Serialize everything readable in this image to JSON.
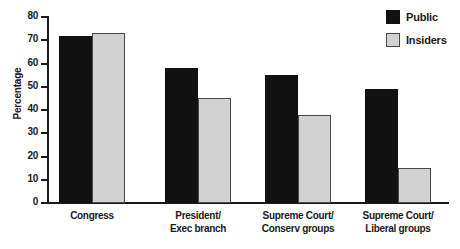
{
  "chart_data": {
    "type": "bar",
    "title": "",
    "xlabel": "",
    "ylabel": "Percentage",
    "ylim": [
      0,
      80
    ],
    "yticks": [
      0,
      10,
      20,
      30,
      40,
      50,
      60,
      70,
      80
    ],
    "ytick_labels": [
      "0",
      "10",
      "20",
      "30",
      "40",
      "50",
      "60",
      "70",
      "80"
    ],
    "grid": false,
    "legend_position": "top-right",
    "categories": [
      "Congress",
      "President/ Exec branch",
      "Supreme Court/ Conserv groups",
      "Supreme Court/ Liberal groups"
    ],
    "category_lines": [
      [
        "Congress",
        ""
      ],
      [
        "President/",
        "Exec branch"
      ],
      [
        "Supreme Court/",
        "Conserv groups"
      ],
      [
        "Supreme Court/",
        "Liberal groups"
      ]
    ],
    "series": [
      {
        "name": "Public",
        "color": "#111111",
        "values": [
          72,
          58,
          55,
          49
        ]
      },
      {
        "name": "Insiders",
        "color": "#d2d2d2",
        "values": [
          73,
          45,
          38,
          15
        ]
      }
    ]
  },
  "legend": {
    "items": [
      {
        "label": "Public"
      },
      {
        "label": "Insiders"
      }
    ]
  },
  "colors": {
    "public": "#111111",
    "insiders": "#d2d2d2",
    "axis": "#1a1a1a",
    "background": "#ffffff"
  }
}
